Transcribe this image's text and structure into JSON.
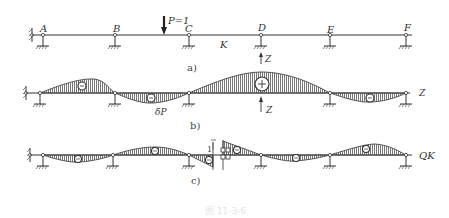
{
  "diagram": {
    "type": "influence-line-continuous-beam",
    "nodes": [
      "A",
      "B",
      "C",
      "D",
      "E",
      "F"
    ],
    "section_label": "K",
    "load_label": "P=1",
    "panels": [
      {
        "id": "a",
        "caption": "a)",
        "description": "Continuous beam with supports A–F and unit load P=1 between B and C; section K between C and D; redundant Z at D"
      },
      {
        "id": "b",
        "caption": "b)",
        "description": "Influence line of Z (deflection δP), positive hump at D",
        "labels": {
          "z_top": "Z",
          "z_bottom": "Z",
          "delta": "δP",
          "end": "Z",
          "plus": "+",
          "minus": "−"
        }
      },
      {
        "id": "c",
        "caption": "c)",
        "description": "Influence line of shear Q_K with unit jump at section K",
        "labels": {
          "unit": "1",
          "end": "QK"
        }
      }
    ],
    "figure_caption": "图 11-3-6"
  },
  "colors": {
    "line": "#333333",
    "hatch": "#555555",
    "caption_faint": "#e4e4e4"
  }
}
